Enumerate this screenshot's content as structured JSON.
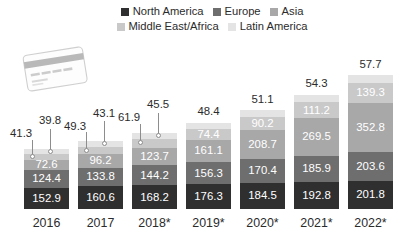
{
  "chart_data": {
    "type": "bar",
    "stacked": true,
    "title": "",
    "subtitle": "",
    "xlabel": "",
    "ylabel": "",
    "grid": false,
    "legend_position": "top",
    "categories": [
      "2016",
      "2017",
      "2018*",
      "2019*",
      "2020*",
      "2021*",
      "2022*"
    ],
    "series": [
      {
        "name": "North America",
        "color": "#2f2f2f",
        "values": [
          152.9,
          160.6,
          168.2,
          176.3,
          184.5,
          192.8,
          201.8
        ]
      },
      {
        "name": "Europe",
        "color": "#6e6e6e",
        "values": [
          124.4,
          133.8,
          144.2,
          156.3,
          170.4,
          185.9,
          203.6
        ]
      },
      {
        "name": "Asia",
        "color": "#a8a8a8",
        "values": [
          72.6,
          96.2,
          123.7,
          161.1,
          208.7,
          269.5,
          352.8
        ]
      },
      {
        "name": "Middle East/Africa",
        "color": "#c9c9c9",
        "values": [
          41.3,
          49.3,
          61.9,
          74.4,
          90.2,
          111.2,
          139.3
        ]
      },
      {
        "name": "Latin America",
        "color": "#e4e4e4",
        "values": [
          39.8,
          43.1,
          45.5,
          48.4,
          51.1,
          54.3,
          57.7
        ]
      }
    ],
    "totals": [
      431.0,
      483.0,
      543.5,
      616.5,
      704.9,
      813.7,
      955.2
    ],
    "label_placement": {
      "note": "Middle East/Africa and Latin America labels are drawn outside above the bar with leader lines for 2016, 2017 and 2018*; for 2019*-2022* Middle East/Africa is inside and Latin America is above the bar.",
      "outside_with_leader": [
        "2016",
        "2017",
        "2018*"
      ],
      "latin_america_above": [
        "2016",
        "2017",
        "2018*",
        "2019*",
        "2020*",
        "2021*",
        "2022*"
      ]
    }
  },
  "legend": {
    "rows": [
      [
        {
          "label": "North America",
          "color": "#2f2f2f",
          "swatch_name": "legend-swatch-north-america"
        },
        {
          "label": "Europe",
          "color": "#6e6e6e",
          "swatch_name": "legend-swatch-europe"
        },
        {
          "label": "Asia",
          "color": "#a8a8a8",
          "swatch_name": "legend-swatch-asia"
        }
      ],
      [
        {
          "label": "Middle East/Africa",
          "color": "#c9c9c9",
          "swatch_name": "legend-swatch-middle-east-africa"
        },
        {
          "label": "Latin America",
          "color": "#e4e4e4",
          "swatch_name": "legend-swatch-latin-america"
        }
      ]
    ]
  },
  "decoration": {
    "credit_card": {
      "name": "credit-card-illustration",
      "card_number_text": "1234 5678 9012 3456",
      "holder_text": "CARD HOLDER"
    }
  },
  "colors": {
    "background": "#ffffff",
    "text": "#2b2b2b",
    "label_on_bar": "#ffffff",
    "leader_line": "#8d8d8d"
  }
}
